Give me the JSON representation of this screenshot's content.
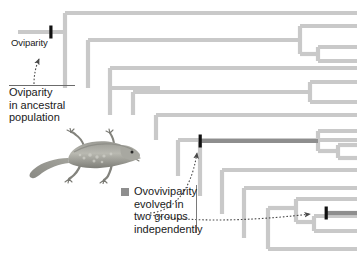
{
  "figure": {
    "type": "phylogenetic-tree-cladogram",
    "background": "#ffffff"
  },
  "colors": {
    "branch_light": "#c9c9c9",
    "branch_dark": "#8e8e8e",
    "tick_root": "#111111",
    "tick_trait": "#111111",
    "text": "#1a1a1a",
    "rule": "#6b6b6b",
    "arrow": "#4a4a4a"
  },
  "annotations": {
    "root_tick_label": "Oviparity",
    "ancestral_note_lines": [
      "Oviparity",
      "in ancestral",
      "population"
    ],
    "ancestral_note_text": "Oviparity in ancestral population"
  },
  "legend": {
    "swatch_color": "#8e8e8e",
    "lines": [
      "Ovoviviparity",
      "evolved in",
      "two groups",
      "independently"
    ],
    "text": "Ovoviviparity evolved in two groups independently"
  },
  "illustration": {
    "name": "lizard-illustration",
    "caption": ""
  },
  "tree": {
    "root_x": 18,
    "tip_x": 357,
    "n_tips": 15,
    "trait_origins": 2,
    "trait_origin_marks": [
      {
        "id": "origin-1",
        "x": 200,
        "y": 141,
        "label": "ovoviviparity-origin-upper"
      },
      {
        "id": "origin-2",
        "x": 326,
        "y": 213,
        "label": "ovoviviparity-origin-lower"
      }
    ],
    "root_mark": {
      "id": "root-oviparity",
      "x": 51,
      "y": 32,
      "label": "oviparity-root"
    }
  }
}
